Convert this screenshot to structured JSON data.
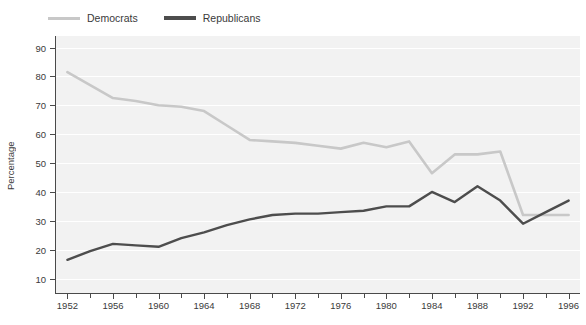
{
  "legend": {
    "position": "top-left",
    "entries": [
      {
        "label": "Democrats",
        "color": "#c8c8c8",
        "name": "legend-democrats"
      },
      {
        "label": "Republicans",
        "color": "#4d4d4d",
        "name": "legend-republicans"
      }
    ]
  },
  "axes": {
    "ylabel": "Percentage",
    "xlabel": "",
    "yticks": [
      "10",
      "20",
      "30",
      "40",
      "50",
      "60",
      "70",
      "80",
      "90"
    ],
    "xticks": [
      "1952",
      "1956",
      "1960",
      "1964",
      "1968",
      "1972",
      "1976",
      "1980",
      "1984",
      "1988",
      "1992",
      "1996"
    ]
  },
  "chart_data": {
    "type": "line",
    "title": "",
    "subtitle": "",
    "xlabel": "",
    "ylabel": "Percentage",
    "xlim": [
      1951,
      1997
    ],
    "ylim": [
      5,
      94
    ],
    "grid": "horizontal-white",
    "legend_position": "top-left",
    "x": [
      1952,
      1954,
      1956,
      1958,
      1960,
      1962,
      1964,
      1966,
      1968,
      1970,
      1972,
      1974,
      1976,
      1978,
      1980,
      1982,
      1984,
      1986,
      1988,
      1990,
      1992,
      1994,
      1996
    ],
    "series": [
      {
        "name": "Democrats",
        "color": "#c8c8c8",
        "values": [
          81.5,
          77,
          72.5,
          71.5,
          70,
          69.5,
          68,
          63,
          58,
          57.5,
          57,
          56,
          55,
          57,
          55.5,
          57.5,
          46.5,
          53,
          53,
          54,
          32,
          32,
          32
        ]
      },
      {
        "name": "Republicans",
        "color": "#4d4d4d",
        "values": [
          16.5,
          19.5,
          22,
          21.5,
          21,
          24,
          26,
          28.5,
          30.5,
          32,
          32.5,
          32.5,
          33,
          33.5,
          35,
          35,
          40,
          36.5,
          42,
          37,
          29,
          33,
          37
        ]
      }
    ]
  }
}
